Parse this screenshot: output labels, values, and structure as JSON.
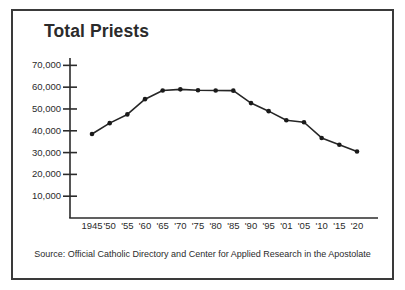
{
  "figure": {
    "title": "Total Priests",
    "source_note": "Source: Official Catholic Directory and Center for Applied Research in the Apostolate",
    "border_color": "#3a3a3a",
    "background_color": "#ffffff",
    "text_color": "#2b2b2b"
  },
  "chart_data": {
    "type": "line",
    "title": "Total Priests",
    "xlabel": "",
    "ylabel": "",
    "categories": [
      "1945",
      "'50",
      "'55",
      "'60",
      "'65",
      "'70",
      "'75",
      "'80",
      "'85",
      "'90",
      "'95",
      "'01",
      "'05",
      "'10",
      "'15",
      "'20"
    ],
    "values": [
      38500,
      43500,
      47500,
      54500,
      58500,
      59000,
      58600,
      58500,
      58400,
      52700,
      49000,
      44800,
      43900,
      36700,
      33600,
      30500
    ],
    "series": [
      {
        "name": "Total Priests",
        "values": [
          38500,
          43500,
          47500,
          54500,
          58500,
          59000,
          58600,
          58500,
          58400,
          52700,
          49000,
          44800,
          43900,
          36700,
          33600,
          30500
        ]
      }
    ],
    "ylim": [
      0,
      72000
    ],
    "yticks": [
      10000,
      20000,
      30000,
      40000,
      50000,
      60000,
      70000
    ],
    "ytick_labels": [
      "10,000",
      "20,000",
      "30,000",
      "40,000",
      "50,000",
      "60,000",
      "70,000"
    ],
    "grid": false,
    "legend": "none",
    "line_color": "#262626",
    "marker": "circle",
    "marker_color": "#1a1a1a"
  }
}
